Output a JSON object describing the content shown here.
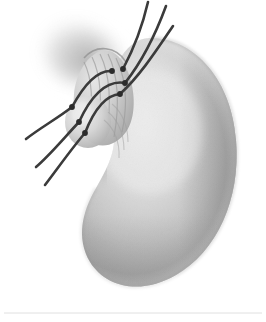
{
  "figure": {
    "caption": "Grayscale medical illustration of a kidney-shaped organ with a tubular stump at the upper-left crossed by six interrupted suture threads with visible knots.",
    "style": "pencil-shaded grayscale anatomical drawing",
    "canvas": {
      "width": 266,
      "height": 322
    }
  },
  "colors": {
    "background": "#ffffff",
    "organ_highlight": "#e4e4e4",
    "organ_midtone": "#c6c6c6",
    "organ_shadow": "#9a9a9a",
    "organ_deep_shadow": "#7e7e7e",
    "halo_shadow": "#b6b6b6",
    "suture_thread": "#3a3a3a",
    "suture_knot": "#2b2b2b",
    "stump_fill": "#cfcfcf",
    "stump_ridge": "#a8a8a8",
    "baseline_rule": "#e0e0e0"
  },
  "parts": [
    {
      "id": "organ-body",
      "label": "Kidney-shaped organ body",
      "interactable": false
    },
    {
      "id": "organ-hilum-notch",
      "label": "Concave hilar notch",
      "interactable": false
    },
    {
      "id": "tubular-stump",
      "label": "Tubular stump at upper-left",
      "interactable": false
    },
    {
      "id": "stump-ridges",
      "label": "Ridged texture on stump",
      "interactable": false
    },
    {
      "id": "halo-shadow",
      "label": "Soft shadow halo behind stump",
      "interactable": false
    },
    {
      "id": "suture-group-upper-right",
      "label": "Three suture threads trailing upper right",
      "interactable": false
    },
    {
      "id": "suture-group-lower-left",
      "label": "Three suture threads trailing lower left",
      "interactable": false
    },
    {
      "id": "suture-knots",
      "label": "Suture knot points",
      "interactable": false
    },
    {
      "id": "baseline-rule",
      "label": "Faint horizontal rule near bottom",
      "interactable": false
    }
  ],
  "sutures": {
    "count": 6,
    "thread_width": 2.6,
    "knot_radius": 2.8,
    "knots": [
      {
        "n": 1,
        "x": 123,
        "y": 69
      },
      {
        "n": 2,
        "x": 112,
        "y": 71
      },
      {
        "n": 3,
        "x": 125,
        "y": 83
      },
      {
        "n": 4,
        "x": 120,
        "y": 94
      },
      {
        "n": 5,
        "x": 72,
        "y": 107
      },
      {
        "n": 6,
        "x": 79,
        "y": 122
      },
      {
        "n": 7,
        "x": 85,
        "y": 133
      }
    ],
    "threads": [
      {
        "n": 1,
        "group": "upper-right",
        "d": "M 123 69 C 132 52, 142 28, 148 2"
      },
      {
        "n": 2,
        "group": "upper-right",
        "d": "M 125 83 C 140 64, 155 36, 166 6"
      },
      {
        "n": 3,
        "group": "upper-right",
        "d": "M 120 94 C 140 76, 158 48, 173 26"
      },
      {
        "n": 4,
        "group": "lower-left",
        "d": "M 72 107 C 58 118, 40 128, 26 139"
      },
      {
        "n": 5,
        "group": "lower-left",
        "d": "M 79 122 C 64 138, 50 155, 36 167"
      },
      {
        "n": 6,
        "group": "lower-left",
        "d": "M 85 133 C 72 148, 58 168, 45 185"
      },
      {
        "n": 7,
        "group": "crossing",
        "d": "M 112 71 C 100 70, 86 81, 72 107"
      },
      {
        "n": 8,
        "group": "crossing",
        "d": "M 125 83 C 108 80, 92 94, 79 122"
      },
      {
        "n": 9,
        "group": "crossing",
        "d": "M 120 94 C 106 95, 94 110, 85 133"
      }
    ]
  },
  "baseline": {
    "y": 313,
    "x1": 4,
    "x2": 262
  }
}
